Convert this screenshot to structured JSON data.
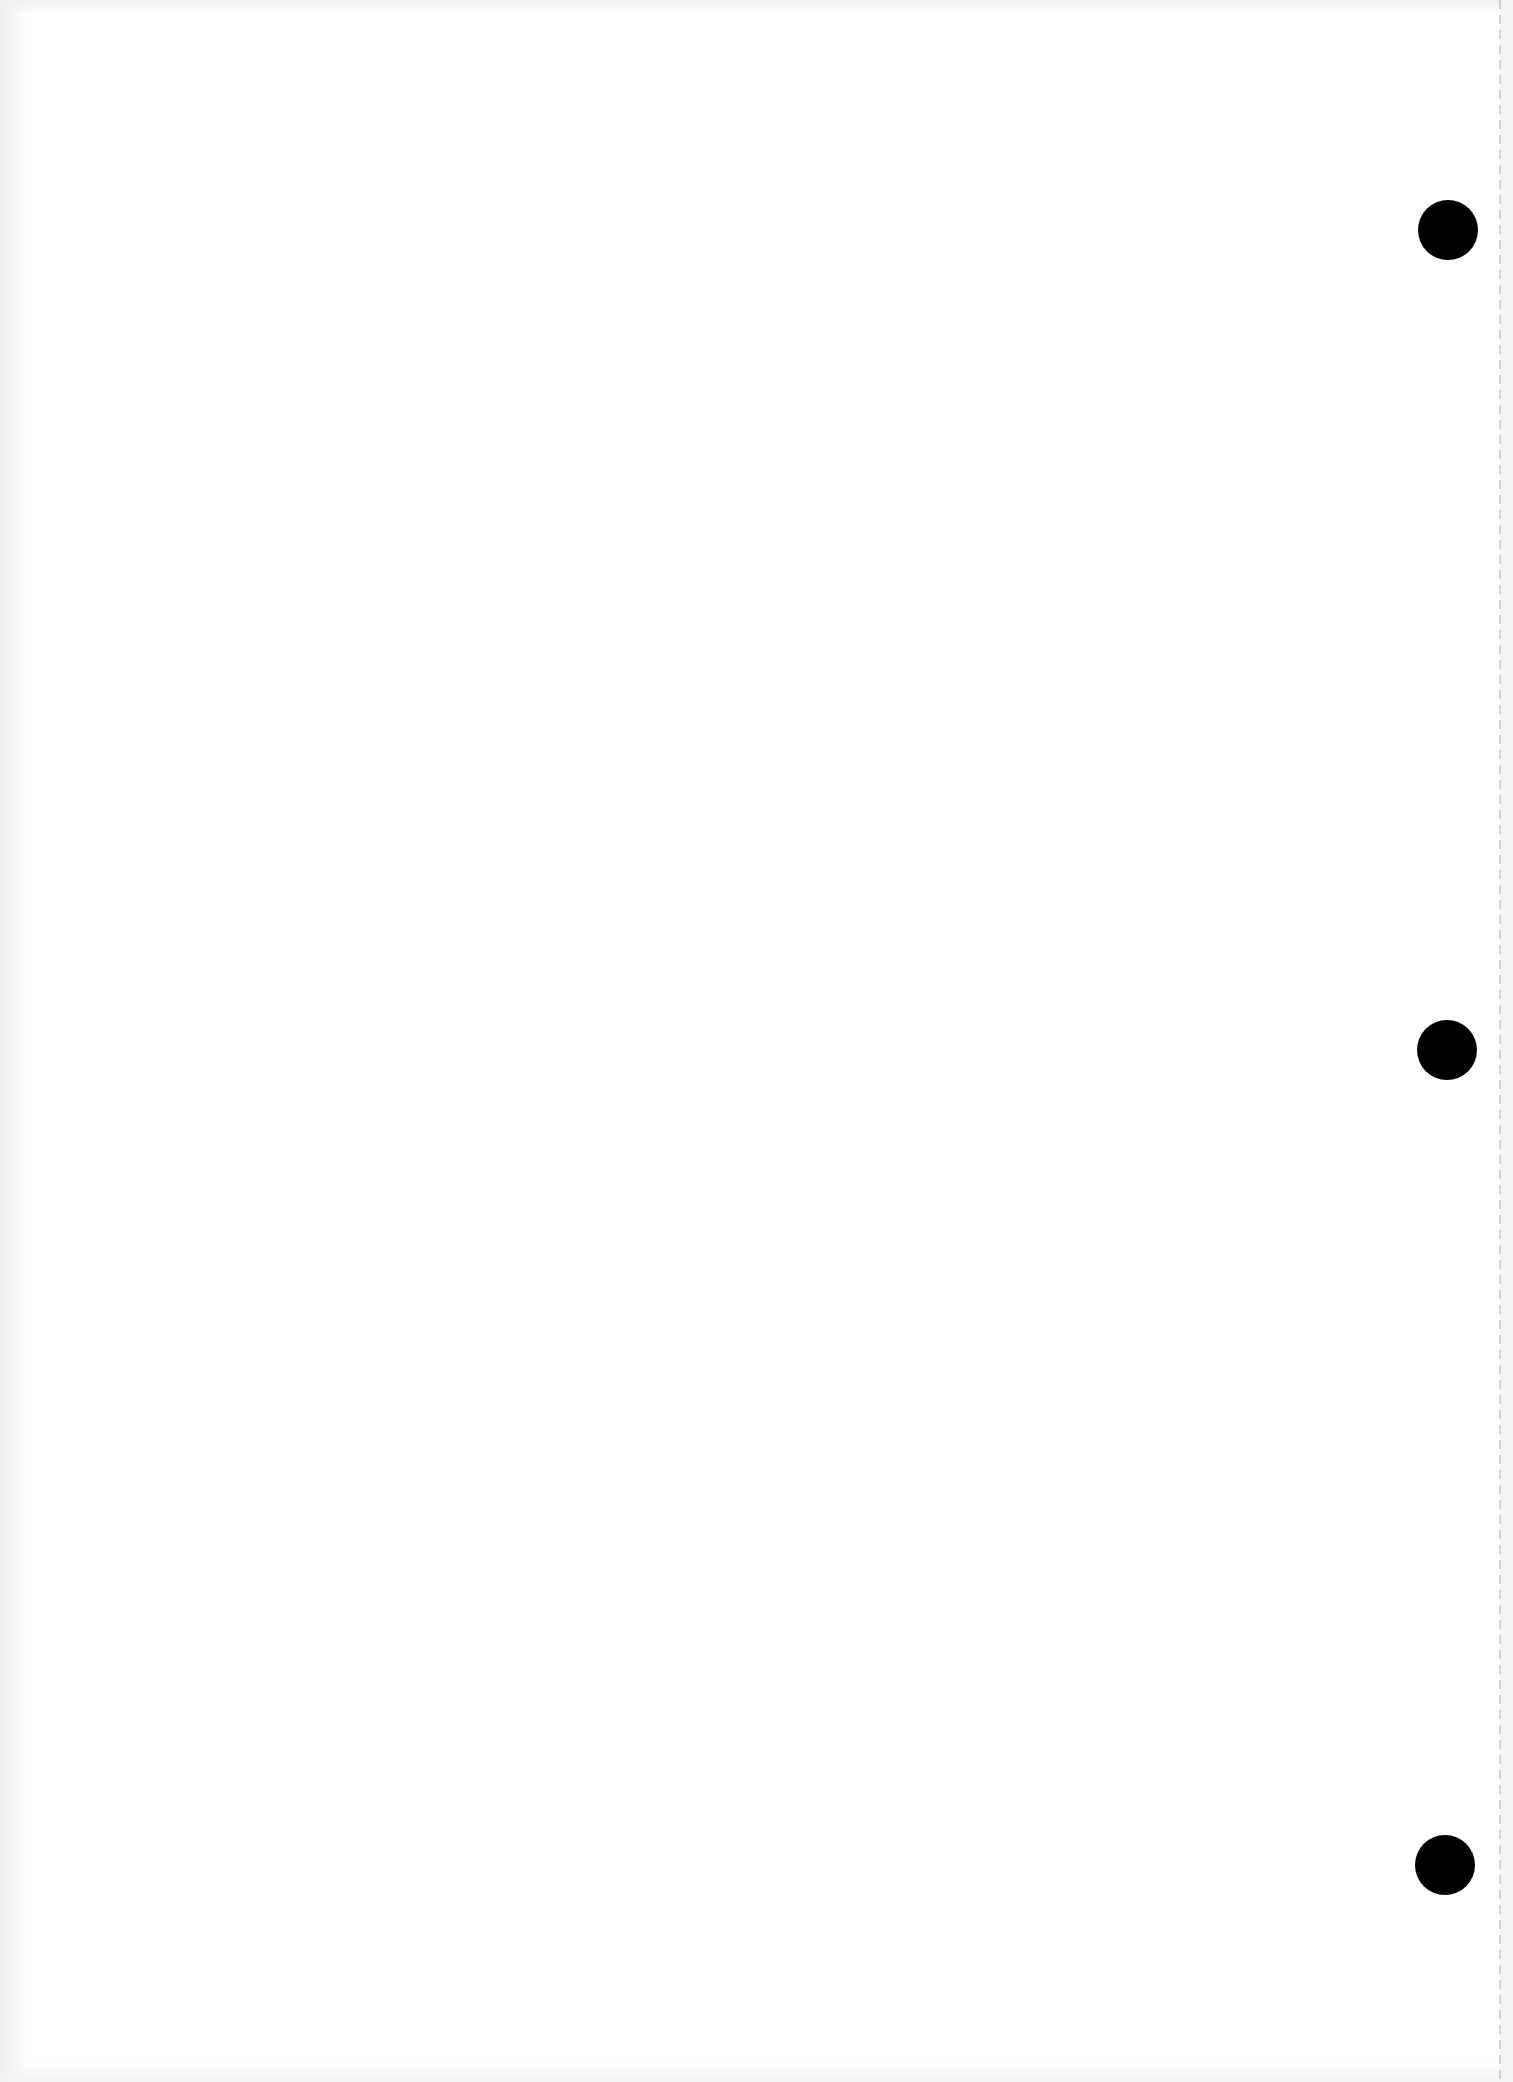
{
  "page": {
    "type": "blank-sheet",
    "background": "#ffffff",
    "text_content": ""
  },
  "perforation": {
    "edge": "right",
    "line_color": "#c9c9c9",
    "strip_color": "#f4f4f4"
  },
  "punch_holes": [
    {
      "cx": 1448,
      "cy": 230,
      "diameter": 60,
      "color": "#000000"
    },
    {
      "cx": 1447,
      "cy": 1050,
      "diameter": 60,
      "color": "#000000"
    },
    {
      "cx": 1445,
      "cy": 1865,
      "diameter": 60,
      "color": "#000000"
    }
  ]
}
